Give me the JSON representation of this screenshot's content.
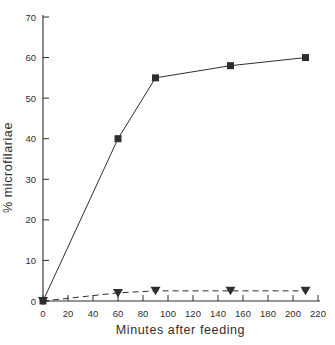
{
  "figure": {
    "background": "#ffffff",
    "ink_color": "#2e2e2e"
  },
  "chart_data": {
    "type": "line",
    "title": "",
    "xlabel": "Minutes after feeding",
    "ylabel": "% microfilariae",
    "xlim": [
      0,
      220
    ],
    "ylim": [
      0,
      70
    ],
    "x_ticks": [
      0,
      20,
      40,
      60,
      80,
      100,
      120,
      140,
      160,
      180,
      200,
      220
    ],
    "y_ticks": [
      0,
      10,
      20,
      30,
      40,
      50,
      60,
      70
    ],
    "grid": false,
    "legend": "none",
    "x": [
      0,
      60,
      90,
      150,
      210
    ],
    "series": [
      {
        "name": "solid-line-filled-squares",
        "marker": "square",
        "line_style": "solid",
        "values": [
          0,
          40,
          55,
          58,
          60
        ]
      },
      {
        "name": "dashed-line-filled-triangles",
        "marker": "triangle-down",
        "line_style": "dashed",
        "values": [
          0,
          2,
          2.5,
          2.5,
          2.5
        ]
      }
    ]
  }
}
